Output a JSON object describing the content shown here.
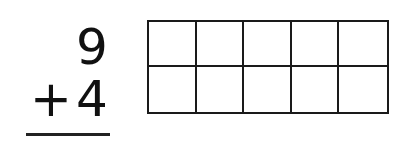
{
  "problem": {
    "addend_top": "9",
    "operator": "+",
    "addend_bottom": "4"
  },
  "ten_frame": {
    "rows": 2,
    "columns": 5,
    "cells": [
      "",
      "",
      "",
      "",
      "",
      "",
      "",
      "",
      "",
      ""
    ]
  }
}
